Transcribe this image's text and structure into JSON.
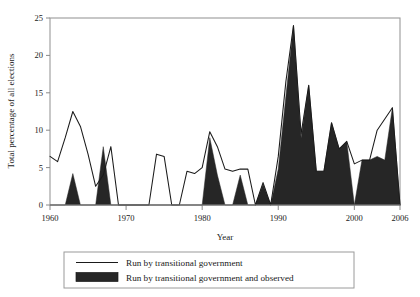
{
  "chart_data": {
    "type": "area",
    "title": "",
    "subtitle": "",
    "xlabel": "Year",
    "ylabel": "Total percentage of all elections",
    "xlim": [
      1960,
      2006
    ],
    "ylim": [
      0,
      25
    ],
    "xticks": [
      1960,
      1970,
      1980,
      1990,
      2000,
      2006
    ],
    "xticklabels": [
      "1960",
      "1970",
      "1980",
      "1990",
      "2000",
      "2006"
    ],
    "yticks": [
      0,
      5,
      10,
      15,
      20,
      25
    ],
    "yticklabels": [
      "0",
      "5",
      "10",
      "15",
      "20",
      "25"
    ],
    "grid": false,
    "legend_position": "below-axes",
    "frame": true,
    "series": [
      {
        "name": "Run by transitional government",
        "style": "line",
        "color": "#1a1a1a",
        "x": [
          1960,
          1961,
          1962,
          1963,
          1964,
          1965,
          1966,
          1967,
          1968,
          1969,
          1970,
          1971,
          1972,
          1973,
          1974,
          1975,
          1976,
          1977,
          1978,
          1979,
          1980,
          1981,
          1982,
          1983,
          1984,
          1985,
          1986,
          1987,
          1988,
          1989,
          1990,
          1991,
          1992,
          1993,
          1994,
          1995,
          1996,
          1997,
          1998,
          1999,
          2000,
          2001,
          2002,
          2003,
          2004,
          2005,
          2006
        ],
        "values": [
          6.5,
          5.8,
          9.0,
          12.5,
          10.5,
          6.8,
          2.5,
          4.0,
          7.8,
          0.0,
          0.0,
          0.0,
          0.0,
          0.0,
          6.8,
          6.5,
          0.0,
          0.0,
          4.5,
          4.2,
          5.0,
          9.8,
          7.8,
          4.8,
          4.5,
          4.8,
          4.8,
          0.0,
          3.0,
          0.0,
          6.5,
          16.5,
          24.0,
          9.5,
          16.0,
          4.5,
          4.5,
          11.0,
          7.5,
          8.5,
          5.5,
          6.0,
          6.0,
          10.0,
          11.5,
          13.0,
          0.0
        ]
      },
      {
        "name": "Run by transitional government and observed",
        "style": "filled-area",
        "color": "#262626",
        "x": [
          1960,
          1961,
          1962,
          1963,
          1964,
          1965,
          1966,
          1967,
          1968,
          1969,
          1970,
          1971,
          1972,
          1973,
          1974,
          1975,
          1976,
          1977,
          1978,
          1979,
          1980,
          1981,
          1982,
          1983,
          1984,
          1985,
          1986,
          1987,
          1988,
          1989,
          1990,
          1991,
          1992,
          1993,
          1994,
          1995,
          1996,
          1997,
          1998,
          1999,
          2000,
          2001,
          2002,
          2003,
          2004,
          2005,
          2006
        ],
        "values": [
          0.0,
          0.0,
          0.0,
          4.2,
          0.0,
          0.0,
          0.0,
          7.8,
          0.0,
          0.0,
          0.0,
          0.0,
          0.0,
          0.0,
          0.0,
          0.0,
          0.0,
          0.0,
          0.0,
          0.0,
          0.0,
          9.0,
          4.0,
          0.0,
          0.0,
          4.0,
          0.0,
          0.0,
          2.8,
          0.0,
          4.8,
          14.5,
          24.0,
          9.0,
          16.0,
          4.5,
          4.5,
          11.0,
          7.5,
          8.5,
          0.0,
          6.0,
          6.0,
          6.5,
          6.0,
          13.0,
          0.0
        ]
      }
    ],
    "legend": [
      {
        "label": "Run by transitional government",
        "marker": "line",
        "color": "#1a1a1a"
      },
      {
        "label": "Run by transitional government and observed",
        "marker": "filled-swatch",
        "color": "#262626"
      }
    ]
  },
  "colors": {
    "line": "#1a1a1a",
    "fill": "#262626",
    "axis": "#8a8a8a",
    "frame": "#9a9a9a",
    "background": "#ffffff"
  }
}
